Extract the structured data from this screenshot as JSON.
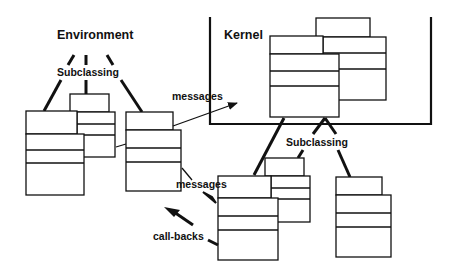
{
  "diagram": {
    "labels": {
      "environment": "Environment",
      "kernel": "Kernel",
      "subclassing_left": "Subclassing",
      "subclassing_right": "Subclassing",
      "messages_top": "messages",
      "messages_bottom": "messages",
      "callbacks": "call-backs"
    },
    "colors": {
      "ink": "#111111",
      "background": "#ffffff"
    },
    "groups": [
      {
        "name": "environment",
        "class_boxes": 3
      },
      {
        "name": "kernel",
        "class_boxes": 2
      },
      {
        "name": "kernel-subclasses",
        "class_boxes": 3
      }
    ]
  }
}
